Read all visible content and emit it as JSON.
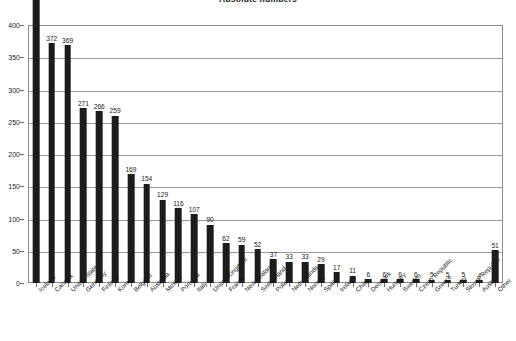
{
  "chart_data": {
    "type": "bar",
    "title": "Absolute numbers",
    "xlabel": "",
    "ylabel": "",
    "ylim": [
      0,
      400
    ],
    "ytick_step": 50,
    "yticks": [
      0,
      50,
      100,
      150,
      200,
      250,
      300,
      350,
      400
    ],
    "grid": true,
    "legend": "none",
    "bar_color": "#1c1c1c",
    "data_labels": true,
    "categories": [
      "Iceland",
      "Canada",
      "United States",
      "Germany",
      "Finland",
      "Korea",
      "Belgium",
      "Australia",
      "Mexico",
      "Portugal",
      "Italy",
      "United Kingdom",
      "France",
      "New Zealand",
      "Switzerland",
      "Poland",
      "Netherlands",
      "Norway",
      "Spain",
      "Ireland",
      "Chile",
      "Denmark",
      "Hungary",
      "Sweden",
      "Czech Republic",
      "Greece",
      "Turkey",
      "Slovak Republic",
      "Austria",
      "Other"
    ],
    "values": [
      471,
      372,
      369,
      271,
      266,
      259,
      169,
      154,
      129,
      116,
      107,
      90,
      62,
      59,
      52,
      37,
      33,
      33,
      29,
      17,
      11,
      6,
      6,
      6,
      6,
      5,
      5,
      5,
      4,
      2
    ],
    "extra_bar": {
      "label": "Other",
      "value": 51
    }
  },
  "axis": {
    "y_max_label": "400",
    "y_min_label": "0"
  }
}
